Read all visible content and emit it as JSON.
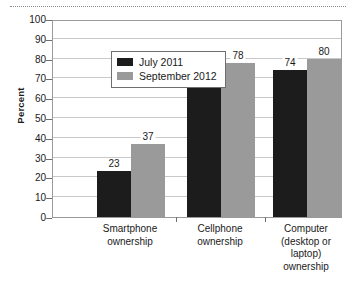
{
  "chart_data": {
    "type": "bar",
    "title": "",
    "subtitle": "",
    "xlabel": "",
    "ylabel": "Percent",
    "ylim": [
      0,
      100
    ],
    "ytick_step": 10,
    "yticks": [
      0,
      10,
      20,
      30,
      40,
      50,
      60,
      70,
      80,
      90,
      100
    ],
    "grid": true,
    "legend_position": "top-left-inside",
    "categories": [
      "Smartphone\nownership",
      "Cellphone\nownership",
      "Computer\n(desktop or\nlaptop)\nownership"
    ],
    "category_lines": [
      [
        "Smartphone",
        "ownership"
      ],
      [
        "Cellphone",
        "ownership"
      ],
      [
        "Computer",
        "(desktop or",
        "laptop)",
        "ownership"
      ]
    ],
    "series": [
      {
        "name": "July 2011",
        "color": "#1c1c1c",
        "values": [
          23,
          77,
          74
        ]
      },
      {
        "name": "September 2012",
        "color": "#9a9a9a",
        "values": [
          37,
          78,
          80
        ]
      }
    ],
    "data_labels": [
      [
        "23",
        "37"
      ],
      [
        "77",
        "78"
      ],
      [
        "74",
        "80"
      ]
    ]
  },
  "legend": {
    "items": [
      {
        "label": "July 2011",
        "color": "#1c1c1c"
      },
      {
        "label": "September 2012",
        "color": "#9a9a9a"
      }
    ]
  },
  "axis": {
    "y_title": "Percent",
    "y_labels": [
      "100",
      "90",
      "80",
      "70",
      "60",
      "50",
      "40",
      "30",
      "20",
      "10",
      "0"
    ]
  },
  "colors": {
    "series_july_2011": "#1c1c1c",
    "series_september_2012": "#9a9a9a",
    "gridline": "#c8c8c8",
    "frame": "#9a9a9a",
    "text": "#1a1a1a",
    "background": "#ffffff"
  }
}
